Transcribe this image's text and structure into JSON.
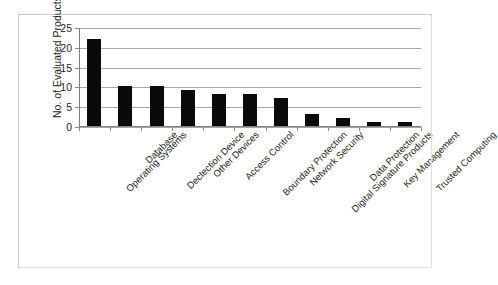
{
  "chart_data": {
    "type": "bar",
    "title": "",
    "subtitle": "",
    "xlabel": "",
    "ylabel": "No. of Evaluated Products",
    "ylim": [
      0,
      25
    ],
    "ytick_labels": [
      "25",
      "20",
      "15",
      "10",
      "5",
      "0"
    ],
    "yticks": [
      25,
      20,
      15,
      10,
      5,
      0
    ],
    "grid": true,
    "legend": false,
    "legend_position": "none",
    "bar_color": "#0a0a0a",
    "categories": [
      "Operating Systems",
      "Database",
      "Dectection Device",
      "Other Devices",
      "Access Control",
      "Boundary Protection",
      "Network Security",
      "Digital Signature Products",
      "Data Protection",
      "Key Management",
      "Trusted Computing"
    ],
    "values": [
      22,
      10,
      10,
      9,
      8,
      8,
      7,
      3,
      2,
      1,
      1
    ]
  },
  "figure": {
    "border_color": "#c9c9c9",
    "background": "#ffffff",
    "axis_color": "#7f7f7f",
    "gridline_color": "#a6a6a6"
  }
}
